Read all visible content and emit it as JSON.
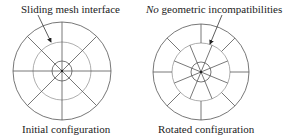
{
  "left_panel": {
    "annotation": "Sliding mesh interface",
    "caption": "Initial configuration"
  },
  "right_panel": {
    "annotation_italic": "No",
    "annotation_rest": " geometric incompatibilities",
    "caption": "Rotated configuration"
  },
  "colors": {
    "stroke": "#555555",
    "interface_stroke": "#999999",
    "text": "#222222"
  }
}
